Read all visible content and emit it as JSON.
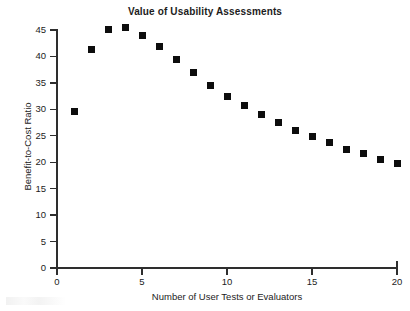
{
  "chart_data": {
    "type": "scatter",
    "title": "Value of Usability Assessments",
    "xlabel": "Number of User Tests or Evaluators",
    "ylabel": "Benefit-to-Cost Ratio",
    "xlim": [
      0,
      20
    ],
    "ylim": [
      0,
      45
    ],
    "grid": false,
    "legend": null,
    "marker": "filled-square",
    "marker_color": "#0d0d0d",
    "x": [
      1,
      2,
      3,
      4,
      5,
      6,
      7,
      8,
      9,
      10,
      11,
      12,
      13,
      14,
      15,
      16,
      17,
      18,
      19,
      20
    ],
    "values": [
      29.5,
      41.4,
      45.1,
      45.4,
      43.9,
      41.8,
      39.4,
      36.9,
      34.6,
      32.5,
      30.7,
      29.0,
      27.5,
      26.0,
      24.8,
      23.7,
      22.4,
      21.6,
      20.6,
      19.8
    ],
    "xticks": [
      0,
      5,
      10,
      15,
      20
    ],
    "xtick_labels": [
      "0",
      "5",
      "10",
      "15",
      "20"
    ],
    "yticks": [
      0,
      5,
      10,
      15,
      20,
      25,
      30,
      35,
      40,
      45
    ],
    "ytick_labels": [
      "0",
      "5",
      "10",
      "15",
      "20",
      "25",
      "30",
      "35",
      "40",
      "45"
    ]
  }
}
